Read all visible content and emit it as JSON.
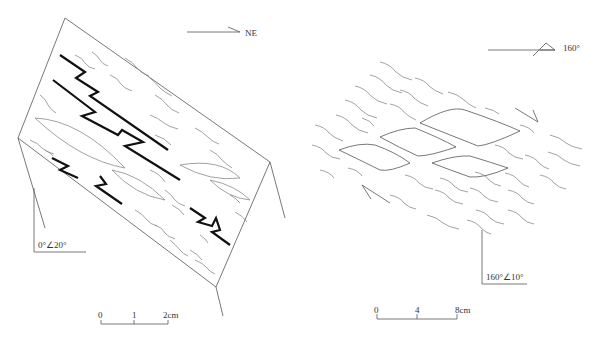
{
  "left_figure": {
    "north_arrow_label": "NE",
    "attitude_label": "0°∠20°",
    "scale_bar": {
      "ticks": [
        "0",
        "1",
        "2cm"
      ]
    }
  },
  "right_figure": {
    "strike_label": "160°",
    "attitude_label": "160°∠10°",
    "scale_bar": {
      "ticks": [
        "0",
        "4",
        "8cm"
      ]
    }
  },
  "colors": {
    "ink": "#111111",
    "line": "#555555",
    "foliation": "#8a8a8a",
    "background": "#ffffff"
  }
}
